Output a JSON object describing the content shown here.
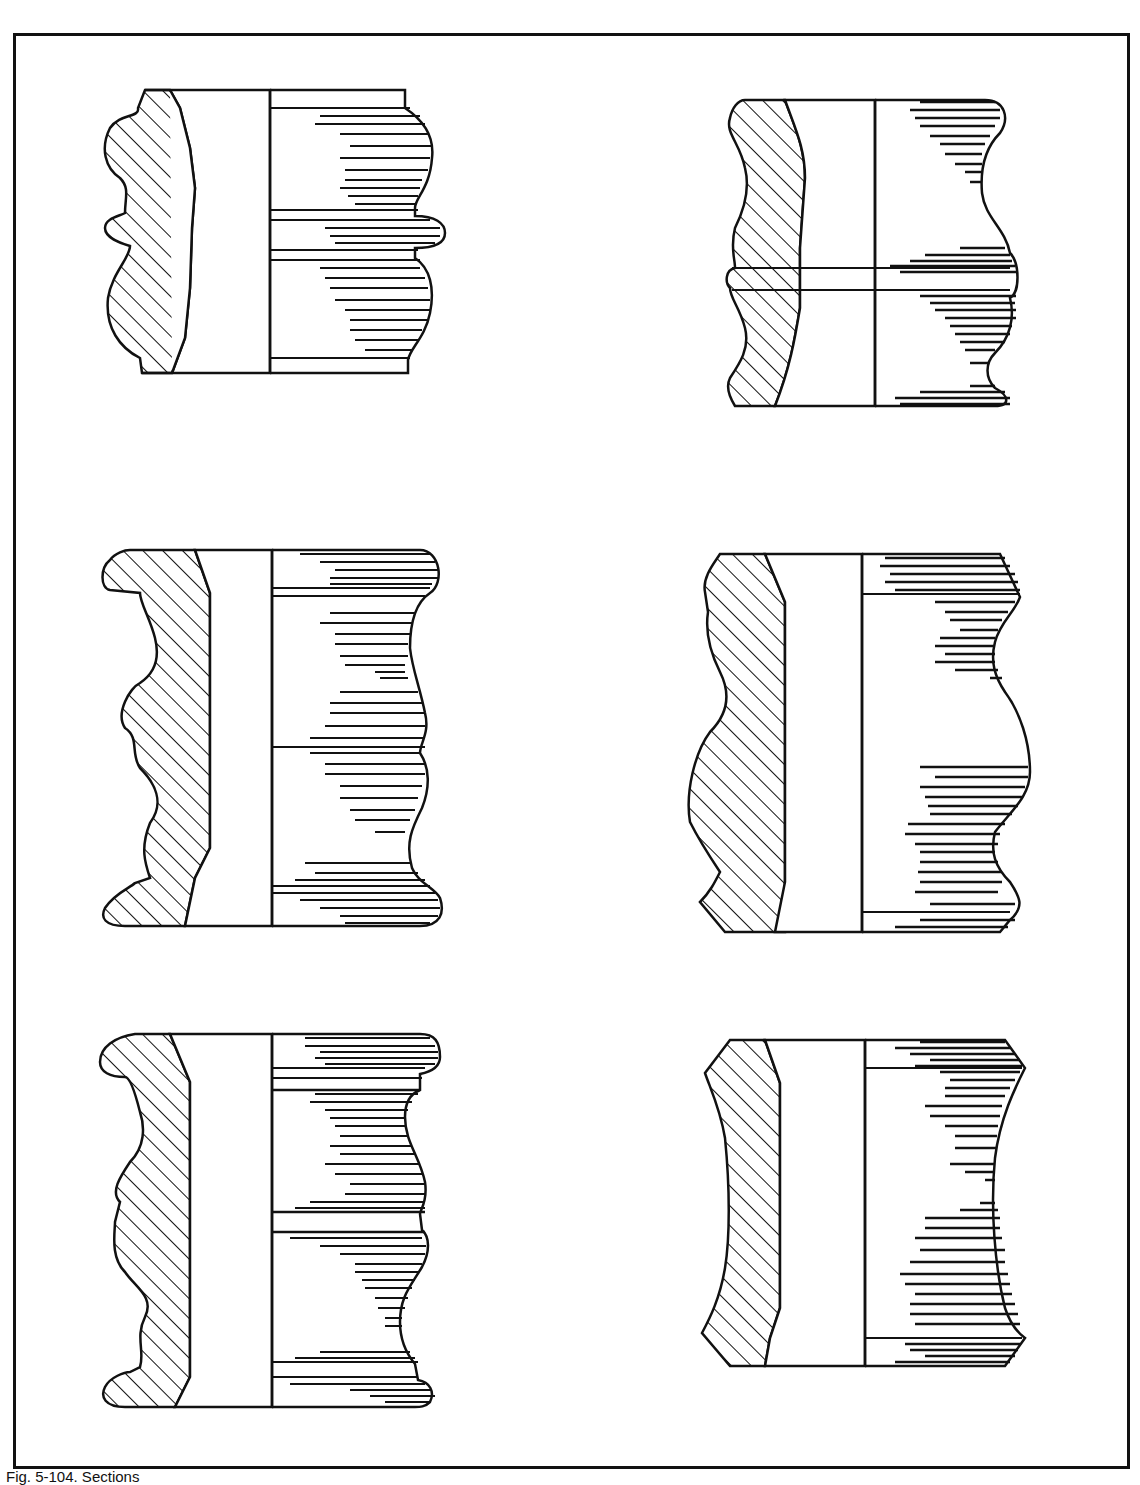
{
  "figure": {
    "caption": "Fig. 5-104. Sections",
    "panels": [
      {
        "id": "section-1",
        "position": "top-left",
        "profile": "bead-and-cove with central round bead"
      },
      {
        "id": "section-2",
        "position": "top-right",
        "profile": "vase profile with central round bead"
      },
      {
        "id": "section-3",
        "position": "middle-left",
        "profile": "double cyma with flared lip and foot"
      },
      {
        "id": "section-4",
        "position": "middle-right",
        "profile": "bulbous vase with chamfered ends"
      },
      {
        "id": "section-5",
        "position": "bottom-left",
        "profile": "multi-bead with fillets and flared ends"
      },
      {
        "id": "section-6",
        "position": "bottom-right",
        "profile": "concave cove with chamfered ends"
      }
    ]
  },
  "colors": {
    "ink": "#111111",
    "paper": "#ffffff"
  }
}
